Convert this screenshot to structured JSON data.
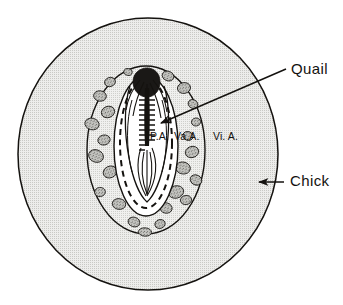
{
  "figure": {
    "background_color": "#ffffff",
    "ink_color": "#14120f"
  },
  "regions": {
    "chick_area": {
      "name": "chick-host-area",
      "fill_color": "#e3e3e1",
      "outline_color": "#14120f",
      "center": [
        148,
        154
      ],
      "radius_x": 130,
      "radius_y": 136
    },
    "vascular_area": {
      "name": "vascular-area-oval",
      "fill_color": "#e8e8e6",
      "outline_color": "#14120f",
      "center": [
        146,
        150
      ],
      "radius_x": 59,
      "radius_y": 84
    },
    "pellucid_area": {
      "name": "area-pellucida-oval",
      "fill_color": "#ffffff",
      "outline_color": "#14120f",
      "center": [
        146,
        146
      ],
      "radius_x": 32,
      "radius_y": 70
    },
    "proamnion": {
      "name": "proamnion-dashed-boundary",
      "stroke_style": "dashed",
      "outline_color": "#14120f",
      "center": [
        146,
        143
      ],
      "radius_x": 26,
      "radius_y": 65
    },
    "embryo": {
      "name": "quail-embryo",
      "fill_color": "#ffffff",
      "outline_color": "#14120f"
    }
  },
  "labels": {
    "quail": {
      "text": "Quail",
      "x": 291,
      "y": 74
    },
    "chick": {
      "text": "Chick",
      "x": 290,
      "y": 186
    },
    "primitive_area": {
      "text": "P.A.",
      "x": 150,
      "y": 140
    },
    "vascular_area": {
      "text": "Va.A.",
      "x": 174,
      "y": 140
    },
    "vitelline_area": {
      "text": "Vi. A.",
      "x": 213,
      "y": 140
    }
  },
  "leaders": {
    "quail_arrow": {
      "name": "quail-leader-arrow",
      "from": [
        286,
        69
      ],
      "to": [
        159,
        124
      ],
      "arrowhead": "at-embryo-end"
    },
    "chick_arrow": {
      "name": "chick-leader-arrow",
      "from": [
        283,
        182
      ],
      "to": [
        259,
        182
      ],
      "arrowhead": "at-circle-edge"
    }
  },
  "blood_islands": {
    "name": "blood-islands",
    "count": 26,
    "fill_color": "#b4b4b0",
    "outline_color": "#14120f",
    "positions": [
      [
        110,
        82,
        5.5,
        4.6,
        -18
      ],
      [
        128,
        72,
        4.2,
        3.4,
        12
      ],
      [
        168,
        76,
        6.0,
        4.8,
        22
      ],
      [
        184,
        88,
        6.6,
        5.4,
        -10
      ],
      [
        100,
        96,
        6.4,
        5.2,
        8
      ],
      [
        193,
        104,
        5.0,
        4.3,
        30
      ],
      [
        108,
        112,
        6.8,
        5.6,
        -22
      ],
      [
        92,
        124,
        7.2,
        5.8,
        14
      ],
      [
        196,
        122,
        4.6,
        4.0,
        -8
      ],
      [
        188,
        136,
        5.2,
        4.4,
        18
      ],
      [
        104,
        140,
        6.2,
        5.0,
        -12
      ],
      [
        96,
        156,
        7.6,
        6.2,
        20
      ],
      [
        192,
        152,
        6.8,
        5.6,
        -16
      ],
      [
        183,
        168,
        7.4,
        6.0,
        10
      ],
      [
        110,
        172,
        7.0,
        5.8,
        -24
      ],
      [
        128,
        186,
        6.4,
        5.2,
        16
      ],
      [
        100,
        192,
        5.4,
        4.6,
        -6
      ],
      [
        196,
        180,
        6.0,
        5.0,
        26
      ],
      [
        176,
        192,
        7.8,
        6.2,
        -14
      ],
      [
        119,
        204,
        6.8,
        5.4,
        8
      ],
      [
        146,
        206,
        7.2,
        5.8,
        -20
      ],
      [
        166,
        208,
        6.2,
        5.2,
        12
      ],
      [
        186,
        200,
        5.6,
        4.6,
        -10
      ],
      [
        134,
        222,
        6.0,
        4.8,
        18
      ],
      [
        160,
        224,
        5.2,
        4.4,
        -16
      ],
      [
        145,
        232,
        6.6,
        4.2,
        4
      ]
    ]
  },
  "embryo_parts": {
    "head": "head-fold-dense-region",
    "neural_tube": "neural-tube-midline",
    "somites": "somite-column",
    "vessels": "vitelline-vessel-branches",
    "tail": "tail-bud-region"
  }
}
